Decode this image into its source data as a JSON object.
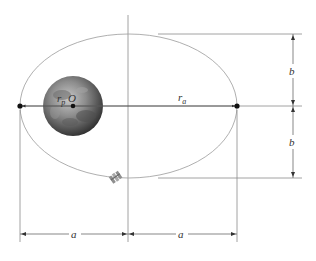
{
  "diagram": {
    "type": "orbit-ellipse",
    "labels": {
      "focus": "O",
      "perigee_radius": "r",
      "perigee_sub": "p",
      "apogee_radius": "r",
      "apogee_sub": "a",
      "semi_minor_top": "b",
      "semi_minor_bottom": "b",
      "semi_major_left": "a",
      "semi_major_right": "a"
    },
    "colors": {
      "line": "#8a8a8a",
      "ellipse": "#9a9a9a",
      "point": "#111111",
      "planet_dark": "#3a3a3a",
      "planet_light": "#b5b5b5"
    }
  }
}
